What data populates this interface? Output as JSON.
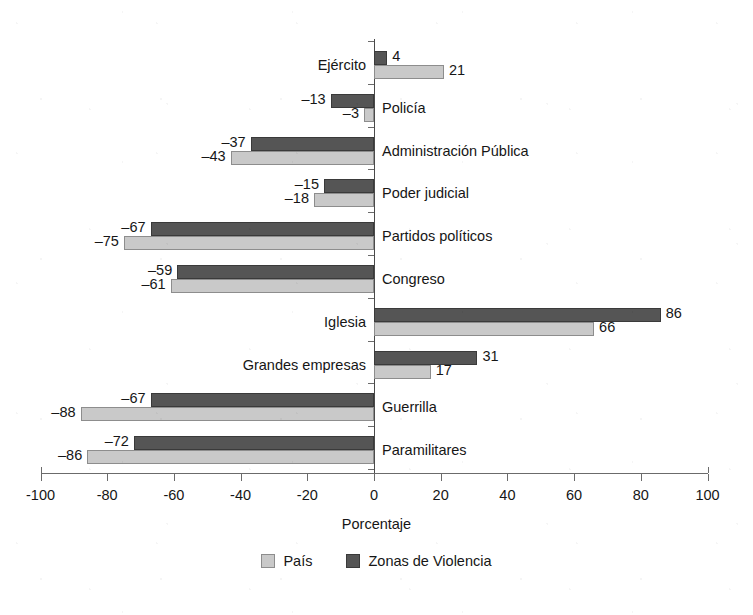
{
  "chart_data": {
    "type": "bar",
    "orientation": "horizontal",
    "title": "",
    "xlabel": "Porcentaje",
    "ylabel": "",
    "xlim": [
      -100,
      100
    ],
    "xticks": [
      -100,
      -80,
      -60,
      -40,
      -20,
      0,
      20,
      40,
      60,
      80,
      100
    ],
    "xtick_labels": [
      "-100",
      "-80",
      "-60",
      "-40",
      "-20",
      "0",
      "20",
      "40",
      "60",
      "80",
      "100"
    ],
    "grid": false,
    "legend_position": "bottom-center",
    "categories": [
      "Ejército",
      "Policía",
      "Administración Pública",
      "Poder judicial",
      "Partidos políticos",
      "Congreso",
      "Iglesia",
      "Grandes empresas",
      "Guerrilla",
      "Paramilitares"
    ],
    "series": [
      {
        "name": "Zonas de Violencia",
        "color": "#555555",
        "values": [
          4,
          -13,
          -37,
          -15,
          -67,
          -59,
          86,
          31,
          -67,
          -72
        ],
        "value_labels": [
          "4",
          "–13",
          "–37",
          "–15",
          "–67",
          "–59",
          "86",
          "31",
          "–67",
          "–72"
        ]
      },
      {
        "name": "País",
        "color": "#c9c9c9",
        "values": [
          21,
          -3,
          -43,
          -18,
          -75,
          -61,
          66,
          17,
          -88,
          -86
        ],
        "value_labels": [
          "21",
          "–3",
          "–43",
          "–18",
          "–75",
          "–61",
          "66",
          "17",
          "–88",
          "–86"
        ]
      }
    ]
  },
  "legend": {
    "items": [
      {
        "label": "País",
        "swatch": "light"
      },
      {
        "label": "Zonas de Violencia",
        "swatch": "dark"
      }
    ]
  }
}
